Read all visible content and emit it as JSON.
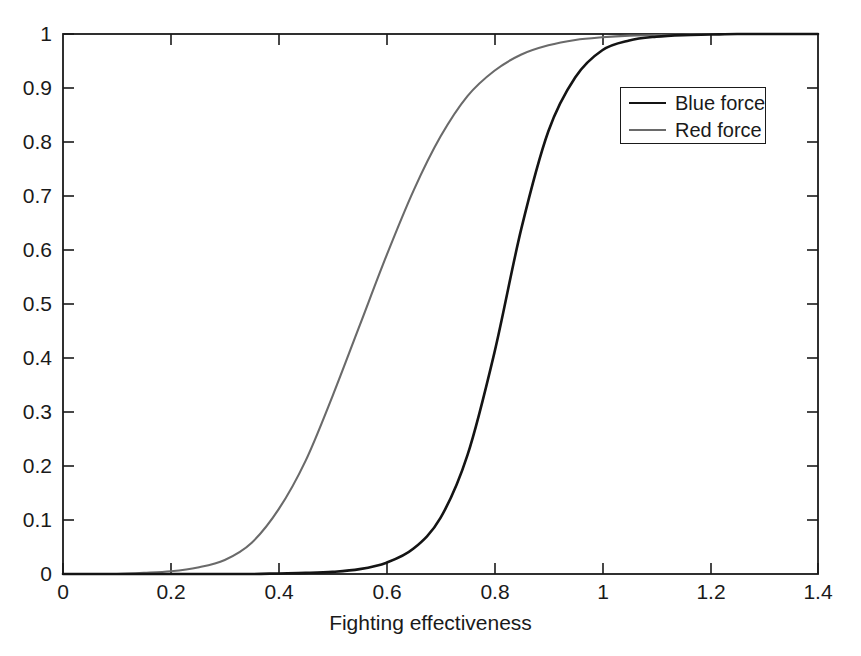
{
  "chart_data": {
    "type": "line",
    "title": "",
    "subtitle": "",
    "xlabel": "Fighting effectiveness",
    "ylabel": "",
    "xlim": [
      0,
      1.4
    ],
    "ylim": [
      0,
      1
    ],
    "grid": false,
    "legend_position": "top-right",
    "xticks": [
      "0",
      "0.2",
      "0.4",
      "0.6",
      "0.8",
      "1",
      "1.2",
      "1.4"
    ],
    "xtick_values": [
      0,
      0.2,
      0.4,
      0.6,
      0.8,
      1.0,
      1.2,
      1.4
    ],
    "yticks": [
      "0",
      "0.1",
      "0.2",
      "0.3",
      "0.4",
      "0.5",
      "0.6",
      "0.7",
      "0.8",
      "0.9",
      "1"
    ],
    "ytick_values": [
      0,
      0.1,
      0.2,
      0.3,
      0.4,
      0.5,
      0.6,
      0.7,
      0.8,
      0.9,
      1.0
    ],
    "x": [
      0,
      0.05,
      0.1,
      0.15,
      0.2,
      0.25,
      0.3,
      0.35,
      0.4,
      0.45,
      0.5,
      0.55,
      0.6,
      0.65,
      0.7,
      0.75,
      0.8,
      0.85,
      0.9,
      0.95,
      1.0,
      1.05,
      1.1,
      1.15,
      1.2,
      1.25,
      1.3,
      1.35,
      1.4
    ],
    "series": [
      {
        "name": "Blue force",
        "color": "#141414",
        "values": [
          0,
          0,
          0,
          0,
          0,
          0,
          0,
          0,
          0.001,
          0.002,
          0.004,
          0.009,
          0.021,
          0.047,
          0.104,
          0.22,
          0.41,
          0.64,
          0.82,
          0.92,
          0.97,
          0.988,
          0.995,
          0.998,
          0.999,
          1.0,
          1.0,
          1.0,
          1.0
        ]
      },
      {
        "name": "Red force",
        "color": "#6a6a6a",
        "values": [
          0,
          0,
          0,
          0.002,
          0.005,
          0.012,
          0.026,
          0.058,
          0.12,
          0.21,
          0.33,
          0.46,
          0.59,
          0.71,
          0.81,
          0.885,
          0.932,
          0.962,
          0.979,
          0.989,
          0.994,
          0.997,
          0.998,
          0.999,
          1.0,
          1.0,
          1.0,
          1.0,
          1.0
        ]
      }
    ],
    "annotations": []
  },
  "legend": {
    "entries": [
      {
        "label": "Blue force",
        "swatch": "blue-line-swatch"
      },
      {
        "label": "Red force",
        "swatch": "red-line-swatch"
      }
    ]
  },
  "axes": {
    "x_title": "Fighting effectiveness",
    "x_tick_labels": [
      "0",
      "0.2",
      "0.4",
      "0.6",
      "0.8",
      "1",
      "1.2",
      "1.4"
    ],
    "y_tick_labels": [
      "0",
      "0.1",
      "0.2",
      "0.3",
      "0.4",
      "0.5",
      "0.6",
      "0.7",
      "0.8",
      "0.9",
      "1"
    ]
  },
  "colors": {
    "blue_force": "#141414",
    "red_force": "#6a6a6a",
    "axis": "#1a1a1a",
    "background": "#ffffff"
  }
}
